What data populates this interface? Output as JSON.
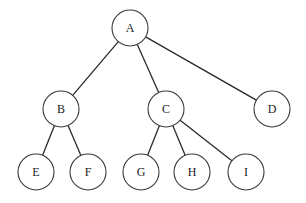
{
  "tree": {
    "nodes": [
      {
        "id": "A",
        "label": "A"
      },
      {
        "id": "B",
        "label": "B"
      },
      {
        "id": "C",
        "label": "C"
      },
      {
        "id": "D",
        "label": "D"
      },
      {
        "id": "E",
        "label": "E"
      },
      {
        "id": "F",
        "label": "F"
      },
      {
        "id": "G",
        "label": "G"
      },
      {
        "id": "H",
        "label": "H"
      },
      {
        "id": "I",
        "label": "I"
      }
    ],
    "edges": [
      [
        "A",
        "B"
      ],
      [
        "A",
        "C"
      ],
      [
        "A",
        "D"
      ],
      [
        "B",
        "E"
      ],
      [
        "B",
        "F"
      ],
      [
        "C",
        "G"
      ],
      [
        "C",
        "H"
      ],
      [
        "C",
        "I"
      ]
    ]
  }
}
